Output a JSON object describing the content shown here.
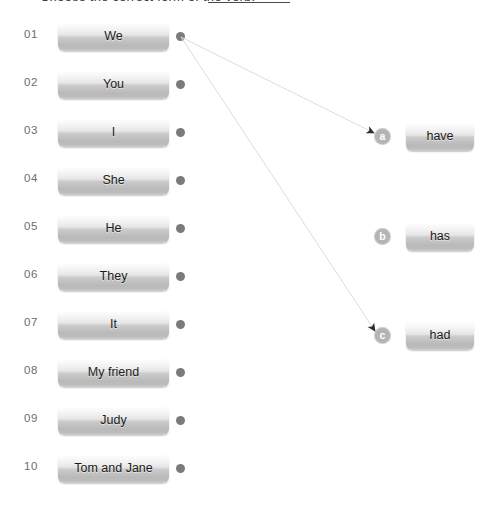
{
  "prompt": {
    "text": "Choose the correct form of the verb:",
    "blank_label": "blank-underline"
  },
  "left_column": {
    "rows": [
      {
        "num": "01",
        "label": "We"
      },
      {
        "num": "02",
        "label": "You"
      },
      {
        "num": "03",
        "label": "I"
      },
      {
        "num": "04",
        "label": "She"
      },
      {
        "num": "05",
        "label": "He"
      },
      {
        "num": "06",
        "label": "They"
      },
      {
        "num": "07",
        "label": "It"
      },
      {
        "num": "08",
        "label": "My friend"
      },
      {
        "num": "09",
        "label": "Judy"
      },
      {
        "num": "10",
        "label": "Tom and Jane"
      }
    ]
  },
  "right_column": {
    "options": [
      {
        "marker": "a",
        "label": "have"
      },
      {
        "marker": "b",
        "label": "has"
      },
      {
        "marker": "c",
        "label": "had"
      }
    ]
  },
  "connections": [
    {
      "from_row": "01",
      "to_marker": "a"
    },
    {
      "from_row": "01",
      "to_marker": "c"
    }
  ],
  "colors": {
    "dot": "#7b7b7b",
    "marker_bg": "#b4b4b4",
    "line": "#d8d8d8",
    "arrowhead": "#2b2b2b",
    "row_number": "#6d6d6d",
    "button_text": "#1b1b1b",
    "background": "#ffffff"
  }
}
